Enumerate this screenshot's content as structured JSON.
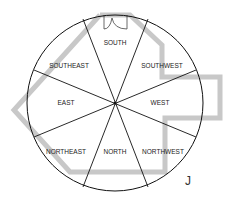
{
  "diagram": {
    "sectors": [
      {
        "label": "SOUTH",
        "x": 115,
        "y": 45
      },
      {
        "label": "SOUTHWEST",
        "x": 162,
        "y": 68
      },
      {
        "label": "WEST",
        "x": 175,
        "y": 105
      },
      {
        "label": "NORTHWEST",
        "x": 162,
        "y": 154
      },
      {
        "label": "NORTH",
        "x": 115,
        "y": 154
      },
      {
        "label": "NORTHEAST",
        "x": 68,
        "y": 154
      },
      {
        "label": "EAST",
        "x": 66,
        "y": 105
      },
      {
        "label": "SOUTHEAST",
        "x": 69,
        "y": 68
      }
    ],
    "corner_mark": "J",
    "colors": {
      "lines": "#111111",
      "outline": "#c8c8c8"
    }
  }
}
